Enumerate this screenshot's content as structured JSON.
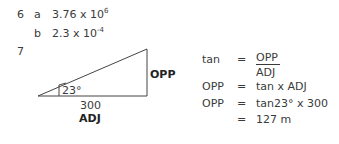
{
  "q6": {
    "number": "6",
    "a": {
      "label": "a",
      "mantissa": "3.76 x 10",
      "exponent": "6"
    },
    "b": {
      "label": "b",
      "mantissa": "2.3 x 10",
      "exponent": "-4"
    }
  },
  "q7": {
    "number": "7",
    "diagram": {
      "angle": "23°",
      "adjacent_value": "300",
      "adjacent_label": "ADJ",
      "opposite_label": "OPP"
    },
    "working": [
      {
        "lhs": "tan",
        "eq": "=",
        "num": "OPP",
        "den": "ADJ"
      },
      {
        "lhs": "OPP",
        "eq": "=",
        "rhs": "tan x ADJ"
      },
      {
        "lhs": "OPP",
        "eq": "=",
        "rhs": "tan23° x 300"
      },
      {
        "lhs": "",
        "eq": "=",
        "rhs": "127 m"
      }
    ]
  }
}
